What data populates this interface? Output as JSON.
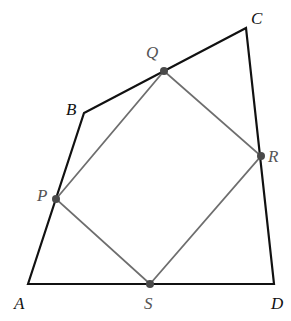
{
  "diagram": {
    "colors": {
      "outer_stroke": "#111111",
      "inner_stroke": "#6e6e6e",
      "point_fill": "#4a4a4a",
      "background": "#ffffff"
    },
    "outer_quadrilateral": {
      "name": "ABCD",
      "vertices": [
        {
          "label": "A",
          "x": 28,
          "y": 284,
          "label_x": 14,
          "label_y": 309
        },
        {
          "label": "B",
          "x": 84,
          "y": 113,
          "label_x": 66,
          "label_y": 115
        },
        {
          "label": "C",
          "x": 246,
          "y": 28,
          "label_x": 251,
          "label_y": 24
        },
        {
          "label": "D",
          "x": 274,
          "y": 284,
          "label_x": 271,
          "label_y": 309
        }
      ]
    },
    "inner_quadrilateral": {
      "name": "PQRS",
      "vertices": [
        {
          "label": "P",
          "x": 56,
          "y": 199,
          "label_x": 37,
          "label_y": 201,
          "on_side": "AB"
        },
        {
          "label": "Q",
          "x": 164,
          "y": 71,
          "label_x": 146,
          "label_y": 58,
          "on_side": "BC"
        },
        {
          "label": "R",
          "x": 261,
          "y": 156,
          "label_x": 268,
          "label_y": 162,
          "on_side": "CD"
        },
        {
          "label": "S",
          "x": 150,
          "y": 284,
          "label_x": 144,
          "label_y": 309,
          "on_side": "AD"
        }
      ]
    }
  }
}
